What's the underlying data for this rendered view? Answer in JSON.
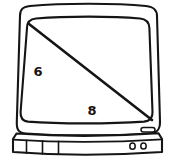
{
  "figure": {
    "background_color": "#ffffff",
    "stroke_color": "#151515",
    "screen_fill": "#ffffff",
    "case_fill": "#ffffff"
  },
  "labels": [
    {
      "id": "leg-vertical",
      "text": "6",
      "x": 38,
      "y": 76,
      "font_size": 13,
      "bold": true,
      "color": "#151515"
    },
    {
      "id": "leg-horizontal",
      "text": "8",
      "x": 92,
      "y": 115,
      "font_size": 13,
      "bold": true,
      "color": "#151515"
    }
  ],
  "geometry": {
    "diagonal": {
      "name": "screen-diagonal",
      "from": {
        "x": 29,
        "y": 24
      },
      "to": {
        "x": 153,
        "y": 120
      },
      "stroke_width": 2.4
    },
    "vertical_leg_value": "6",
    "horizontal_leg_value": "8"
  },
  "parts": {
    "outer_case_label": "tv-outer-case",
    "screen_label": "tv-screen",
    "base_label": "tv-base",
    "badge_label": "tv-brand-badge",
    "knobs_label": "tv-control-knobs",
    "vents_label": "tv-base-vents"
  }
}
